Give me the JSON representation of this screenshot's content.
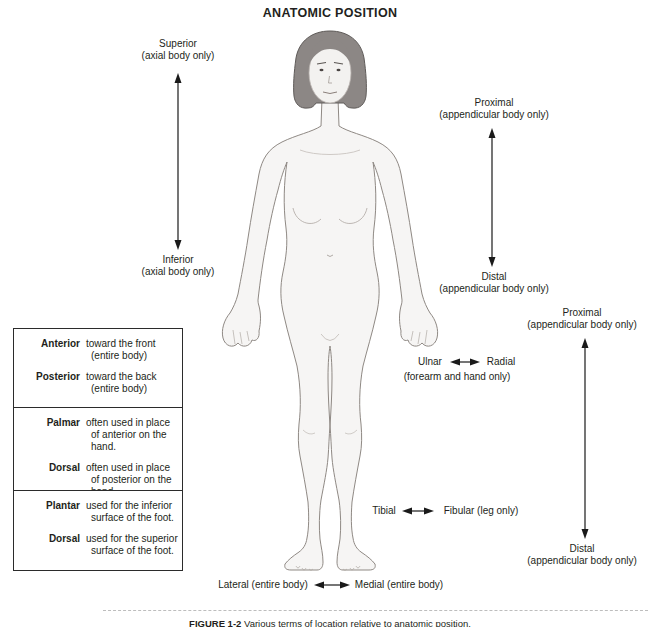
{
  "title": "ANATOMIC POSITION",
  "figure_alt": "Female human figure standing in anatomic position, palms facing forward",
  "direction_groups": {
    "axial": {
      "top": "Superior",
      "top_sub": "(axial body only)",
      "bottom": "Inferior",
      "bottom_sub": "(axial body only)"
    },
    "appendicular_arm": {
      "top": "Proximal",
      "top_sub": "(appendicular body only)",
      "bottom": "Distal",
      "bottom_sub": "(appendicular body only)"
    },
    "appendicular_leg": {
      "top": "Proximal",
      "top_sub": "(appendicular body only)",
      "bottom": "Distal",
      "bottom_sub": "(appendicular body only)"
    },
    "forearm": {
      "left": "Ulnar",
      "right": "Radial",
      "sub": "(forearm and hand only)"
    },
    "leg": {
      "left": "Tibial",
      "right": "Fibular (leg only)"
    },
    "body_width": {
      "left": "Lateral (entire body)",
      "right": "Medial (entire body)"
    }
  },
  "boxes": [
    {
      "entries": [
        {
          "term": "Anterior",
          "def1": "toward the front",
          "def2": "(entire body)"
        },
        {
          "term": "Posterior",
          "def1": "toward the back",
          "def2": "(entire body)"
        }
      ]
    },
    {
      "entries": [
        {
          "term": "Palmar",
          "def1": "often used in place",
          "def2": "of anterior on the hand."
        },
        {
          "term": "Dorsal",
          "def1": "often used in place",
          "def2": "of posterior on the hand."
        }
      ]
    },
    {
      "entries": [
        {
          "term": "Plantar",
          "def1": "used for the inferior",
          "def2": "surface of the foot."
        },
        {
          "term": "Dorsal",
          "def1": "used for the superior",
          "def2": "surface of the foot."
        }
      ]
    }
  ],
  "caption": {
    "label": "FIGURE 1-2",
    "text": "Various terms of location relative to anatomic position."
  },
  "colors": {
    "text": "#231f20",
    "arrow": "#1a1a1a",
    "hair": "#8c8785",
    "hair_outline": "#5f5b59",
    "skin": "#f6f5f4",
    "body_outline": "#8f8984",
    "box_border": "#2b2b2b",
    "dash": "#bdbdbd"
  }
}
